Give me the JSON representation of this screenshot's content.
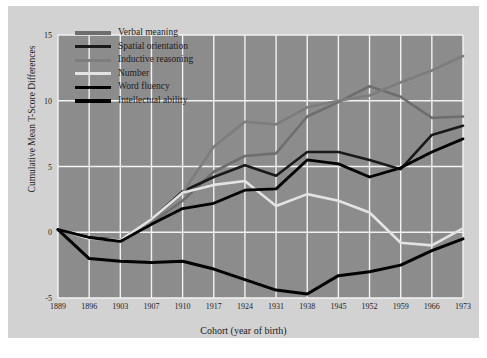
{
  "figure": {
    "background_color": "#ffffff",
    "panel_color": "#d2d2d2",
    "plot_color": "#8c8c8c",
    "grid_color": "#f2f2f2"
  },
  "chart_data": {
    "type": "line",
    "title": "",
    "xlabel": "Cohort (year of birth)",
    "ylabel": "Cumulative Mean T-Score Differences",
    "categories": [
      "1889",
      "1896",
      "1903",
      "1907",
      "1910",
      "1917",
      "1924",
      "1931",
      "1938",
      "1945",
      "1952",
      "1959",
      "1966",
      "1973"
    ],
    "x": [
      1889,
      1896,
      1903,
      1907,
      1910,
      1917,
      1924,
      1931,
      1938,
      1945,
      1952,
      1959,
      1966,
      1973
    ],
    "ylim": [
      -5,
      15
    ],
    "yticks": [
      -5,
      0,
      5,
      10,
      15
    ],
    "ytick_labels": [
      "-5",
      "0",
      "5",
      "10",
      "15"
    ],
    "grid": true,
    "legend_position": "top-left",
    "series": [
      {
        "name": "Verbal meaning",
        "color": "#6e6e6e",
        "width": 2.6,
        "values": [
          0.2,
          -0.5,
          -0.7,
          0.7,
          2.4,
          4.6,
          5.8,
          6.0,
          8.8,
          9.9,
          11.1,
          10.3,
          8.7,
          8.8
        ]
      },
      {
        "name": "Spatial orientation",
        "color": "#1a1a1a",
        "width": 2.6,
        "values": [
          0.2,
          -0.4,
          -0.6,
          1.0,
          3.1,
          4.2,
          5.1,
          4.3,
          6.1,
          6.1,
          5.5,
          4.8,
          7.4,
          8.1
        ]
      },
      {
        "name": "Inductive reasoning",
        "color": "#7d7d7d",
        "width": 2.6,
        "values": [
          0.2,
          -0.5,
          -0.6,
          0.8,
          3.0,
          6.5,
          8.4,
          8.2,
          9.5,
          10.0,
          10.4,
          11.4,
          12.3,
          13.4
        ]
      },
      {
        "name": "Number",
        "color": "#e3e3e3",
        "width": 2.6,
        "values": [
          0.2,
          -0.5,
          -0.6,
          1.0,
          3.0,
          3.6,
          3.9,
          2.0,
          2.9,
          2.4,
          1.5,
          -0.8,
          -1.0,
          0.3
        ]
      },
      {
        "name": "Word fluency",
        "color": "#000000",
        "width": 2.8,
        "values": [
          0.2,
          -0.4,
          -0.7,
          0.6,
          1.8,
          2.2,
          3.2,
          3.3,
          5.5,
          5.2,
          4.2,
          4.9,
          6.1,
          7.1
        ]
      },
      {
        "name": "Intellectual ability",
        "color": "#000000",
        "width": 3.0,
        "values": [
          0.2,
          -2.0,
          -2.2,
          -2.3,
          -2.2,
          -2.8,
          -3.6,
          -4.4,
          -4.7,
          -3.3,
          -3.0,
          -2.5,
          -1.4,
          -0.5
        ]
      }
    ]
  }
}
